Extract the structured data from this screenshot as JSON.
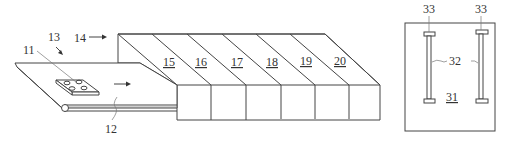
{
  "figure": {
    "labels": {
      "conveyor_item": "11",
      "conveyor_belt": "12",
      "conveyor_assembly": "13",
      "tunnel": "14",
      "zones": [
        "15",
        "16",
        "17",
        "18",
        "19",
        "20"
      ],
      "panel": "31",
      "rails": "32",
      "rail_end_left": "33",
      "rail_end_right": "33"
    },
    "line_color": "#444444",
    "background": "#ffffff"
  }
}
